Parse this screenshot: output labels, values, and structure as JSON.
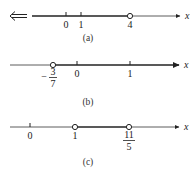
{
  "figures": [
    {
      "caption": "(a)",
      "axis_label": "x",
      "left_arrow": "double-left-arrow",
      "ticks": [
        {
          "value": "0",
          "label": "0"
        },
        {
          "value": "1",
          "label": "1"
        }
      ],
      "open_points": [
        {
          "value": "4",
          "label": "4"
        }
      ],
      "shaded": "x < 4"
    },
    {
      "caption": "(b)",
      "axis_label": "x",
      "ticks": [
        {
          "value": "0",
          "label": "0"
        },
        {
          "value": "1",
          "label": "1"
        }
      ],
      "open_points": [
        {
          "value": "-3/7",
          "label_sign": "−",
          "label_num": "3",
          "label_den": "7"
        }
      ],
      "shaded": "x > -3/7"
    },
    {
      "caption": "(c)",
      "axis_label": "x",
      "ticks": [
        {
          "value": "0",
          "label": "0"
        }
      ],
      "open_points": [
        {
          "value": "1",
          "label": "1"
        },
        {
          "value": "11/5",
          "label_num": "11",
          "label_den": "5"
        }
      ],
      "shaded": "1 < x < 11/5"
    }
  ]
}
